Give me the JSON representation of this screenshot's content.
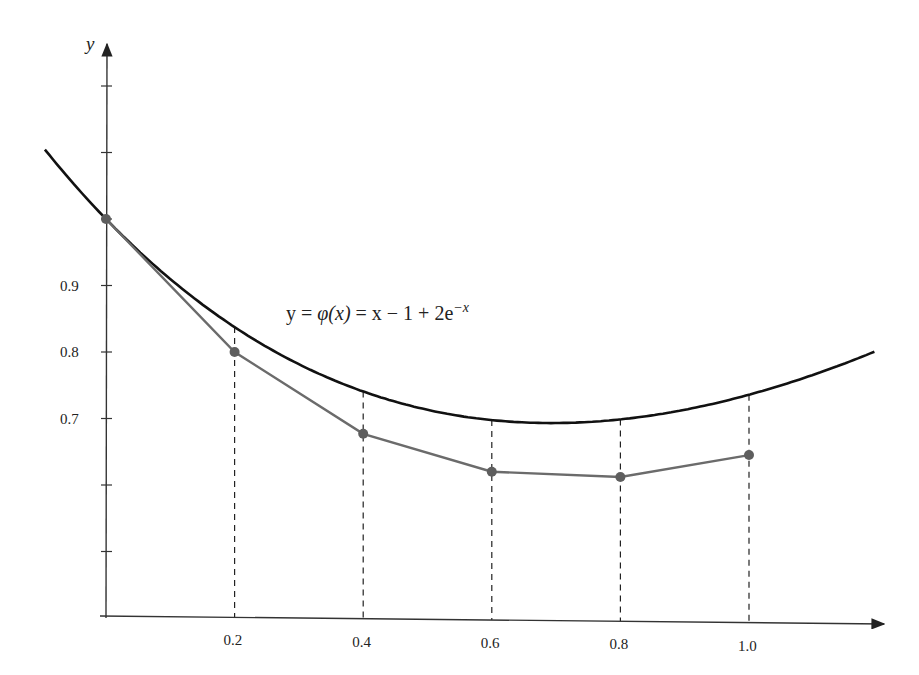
{
  "chart_data": {
    "type": "line",
    "title": "",
    "equation_label": {
      "prefix": "y = ",
      "phi": "φ(x)",
      "body": " = x − 1 + 2e",
      "superscript": "−x"
    },
    "xlabel": "",
    "ylabel": "y",
    "x_ticks": [
      "0.2",
      "0.4",
      "0.6",
      "0.8",
      "1.0"
    ],
    "y_ticks": [
      "0.9",
      "0.8",
      "0.7"
    ],
    "xlim": [
      -0.1,
      1.2
    ],
    "ylim": [
      0.4,
      1.27
    ],
    "grid": false,
    "series": [
      {
        "name": "y = φ(x) = x − 1 + 2e^(−x)",
        "style": "smooth curve, black",
        "color": "#111111",
        "function": "x - 1 + 2*exp(-x)"
      },
      {
        "name": "Euler approximation",
        "style": "polyline with dot markers, gray",
        "color": "#6b6b6b",
        "x": [
          0.0,
          0.2,
          0.4,
          0.6,
          0.8,
          1.0
        ],
        "y": [
          1.0,
          0.8,
          0.677,
          0.62,
          0.612,
          0.645
        ]
      }
    ],
    "dashed_guides_at_x": [
      0.2,
      0.4,
      0.6,
      0.8,
      1.0
    ]
  }
}
